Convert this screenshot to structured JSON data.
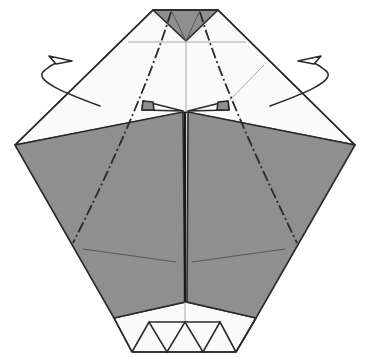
{
  "diagram": {
    "colors": {
      "paper_front": "#fafafa",
      "paper_back": "#8f8f8f",
      "line": "#2a2a2a",
      "crease": "#a8a8a8"
    },
    "annotations": [
      {
        "type": "fold-behind-arrow",
        "side": "left"
      },
      {
        "type": "fold-behind-arrow",
        "side": "right"
      },
      {
        "type": "mountain-fold-line",
        "side": "left"
      },
      {
        "type": "mountain-fold-line",
        "side": "right"
      }
    ],
    "bottom_pleats": 4
  }
}
